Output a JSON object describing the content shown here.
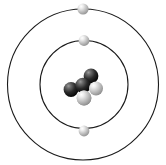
{
  "figure": {
    "width": 166,
    "height": 165,
    "background_color": "#ffffff"
  },
  "nucleus": {
    "label": "nucleus",
    "center": {
      "x": 83,
      "y": 85
    },
    "proton_count": 3,
    "neutron_count": 3,
    "particle_count": 6,
    "proton_color": "#141414",
    "neutron_color": "#b5b5b5",
    "particles": [
      {
        "type": "neutron",
        "cx": 75.5,
        "cy": 76.5,
        "r": 7.6,
        "color": "#b8b8b8",
        "highlight": "#f2f2f2"
      },
      {
        "type": "proton",
        "cx": 91.0,
        "cy": 76.0,
        "r": 7.4,
        "color": "#1c1c1c",
        "highlight": "#9a9a9a"
      },
      {
        "type": "proton",
        "cx": 71.0,
        "cy": 89.5,
        "r": 7.4,
        "color": "#1c1c1c",
        "highlight": "#9a9a9a"
      },
      {
        "type": "proton",
        "cx": 83.0,
        "cy": 85.5,
        "r": 7.8,
        "color": "#0f0f0f",
        "highlight": "#8a8a8a"
      },
      {
        "type": "neutron",
        "cx": 96.0,
        "cy": 88.5,
        "r": 7.0,
        "color": "#bcbcbc",
        "highlight": "#f4f4f4"
      },
      {
        "type": "neutron",
        "cx": 84.0,
        "cy": 98.0,
        "r": 7.4,
        "color": "#b8b8b8",
        "highlight": "#f2f2f2"
      }
    ]
  },
  "orbits": [
    {
      "name": "inner-orbit",
      "shell_label": "K",
      "cx": 84,
      "cy": 84.5,
      "r": 44,
      "stroke_color": "#1a1a1a",
      "stroke_width": 1.1,
      "electron_count": 2
    },
    {
      "name": "outer-orbit",
      "shell_label": "L",
      "cx": 83,
      "cy": 84.5,
      "r": 75.5,
      "stroke_color": "#1a1a1a",
      "stroke_width": 1.1,
      "electron_count": 1
    }
  ],
  "electrons": [
    {
      "name": "electron-outer-top",
      "orbit": "outer-orbit",
      "cx": 83.0,
      "cy": 9.0,
      "r": 5.6,
      "color": "#b0b0b0",
      "highlight": "#f5f5f5"
    },
    {
      "name": "electron-inner-top",
      "orbit": "inner-orbit",
      "cx": 84.0,
      "cy": 40.5,
      "r": 5.4,
      "color": "#b0b0b0",
      "highlight": "#f5f5f5"
    },
    {
      "name": "electron-inner-bottom",
      "orbit": "inner-orbit",
      "cx": 84.0,
      "cy": 131.0,
      "r": 5.4,
      "color": "#b0b0b0",
      "highlight": "#f5f5f5"
    }
  ]
}
